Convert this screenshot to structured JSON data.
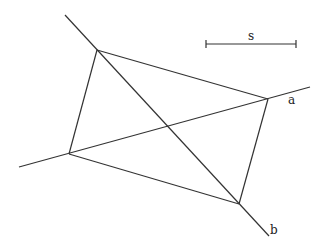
{
  "diagram": {
    "labels": {
      "line_a": "a",
      "line_b": "b",
      "scale": "s"
    },
    "colors": {
      "stroke": "#333333",
      "background": "#ffffff"
    },
    "points": {
      "top_left": [
        97,
        50
      ],
      "right": [
        268,
        99
      ],
      "bottom": [
        239,
        204
      ],
      "left": [
        69,
        154
      ]
    },
    "lines": {
      "a": {
        "from": [
          19,
          167
        ],
        "to": [
          310,
          87
        ]
      },
      "b": {
        "from": [
          65,
          15
        ],
        "to": [
          269,
          236
        ]
      }
    },
    "scale_bar": {
      "from": [
        206,
        44
      ],
      "to": [
        296,
        44
      ]
    }
  }
}
